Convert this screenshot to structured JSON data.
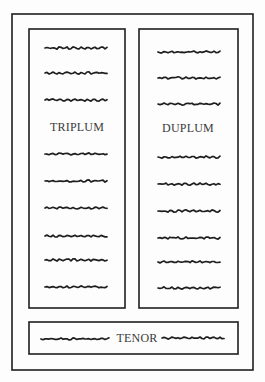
{
  "diagram": {
    "ink_color": "#1e1e1e",
    "paper_color": "#fdfdfd",
    "outer_frame": {
      "x": 12,
      "y": 14,
      "w": 241,
      "h": 356
    },
    "voices": [
      {
        "name": "TRIPLUM",
        "box": {
          "x": 29,
          "y": 29,
          "w": 96,
          "h": 279
        },
        "label_pos": {
          "x": 77,
          "y": 127
        },
        "text_lines_y": [
          48,
          73,
          100,
          154,
          181,
          208,
          236,
          260,
          287
        ],
        "line_x": [
          45,
          107
        ]
      },
      {
        "name": "DUPLUM",
        "box": {
          "x": 139,
          "y": 29,
          "w": 99,
          "h": 279
        },
        "label_pos": {
          "x": 188,
          "y": 128
        },
        "text_lines_y": [
          52,
          78,
          104,
          157,
          184,
          211,
          238,
          262,
          288
        ],
        "line_x": [
          158,
          220
        ]
      },
      {
        "name": "TENOR",
        "box": {
          "x": 29,
          "y": 322,
          "w": 209,
          "h": 32
        },
        "label_pos": {
          "x": 137,
          "y": 338
        },
        "text_lines": [
          {
            "y": 339,
            "x": [
              41,
              110
            ]
          },
          {
            "y": 338,
            "x": [
              162,
              225
            ]
          }
        ]
      }
    ]
  }
}
